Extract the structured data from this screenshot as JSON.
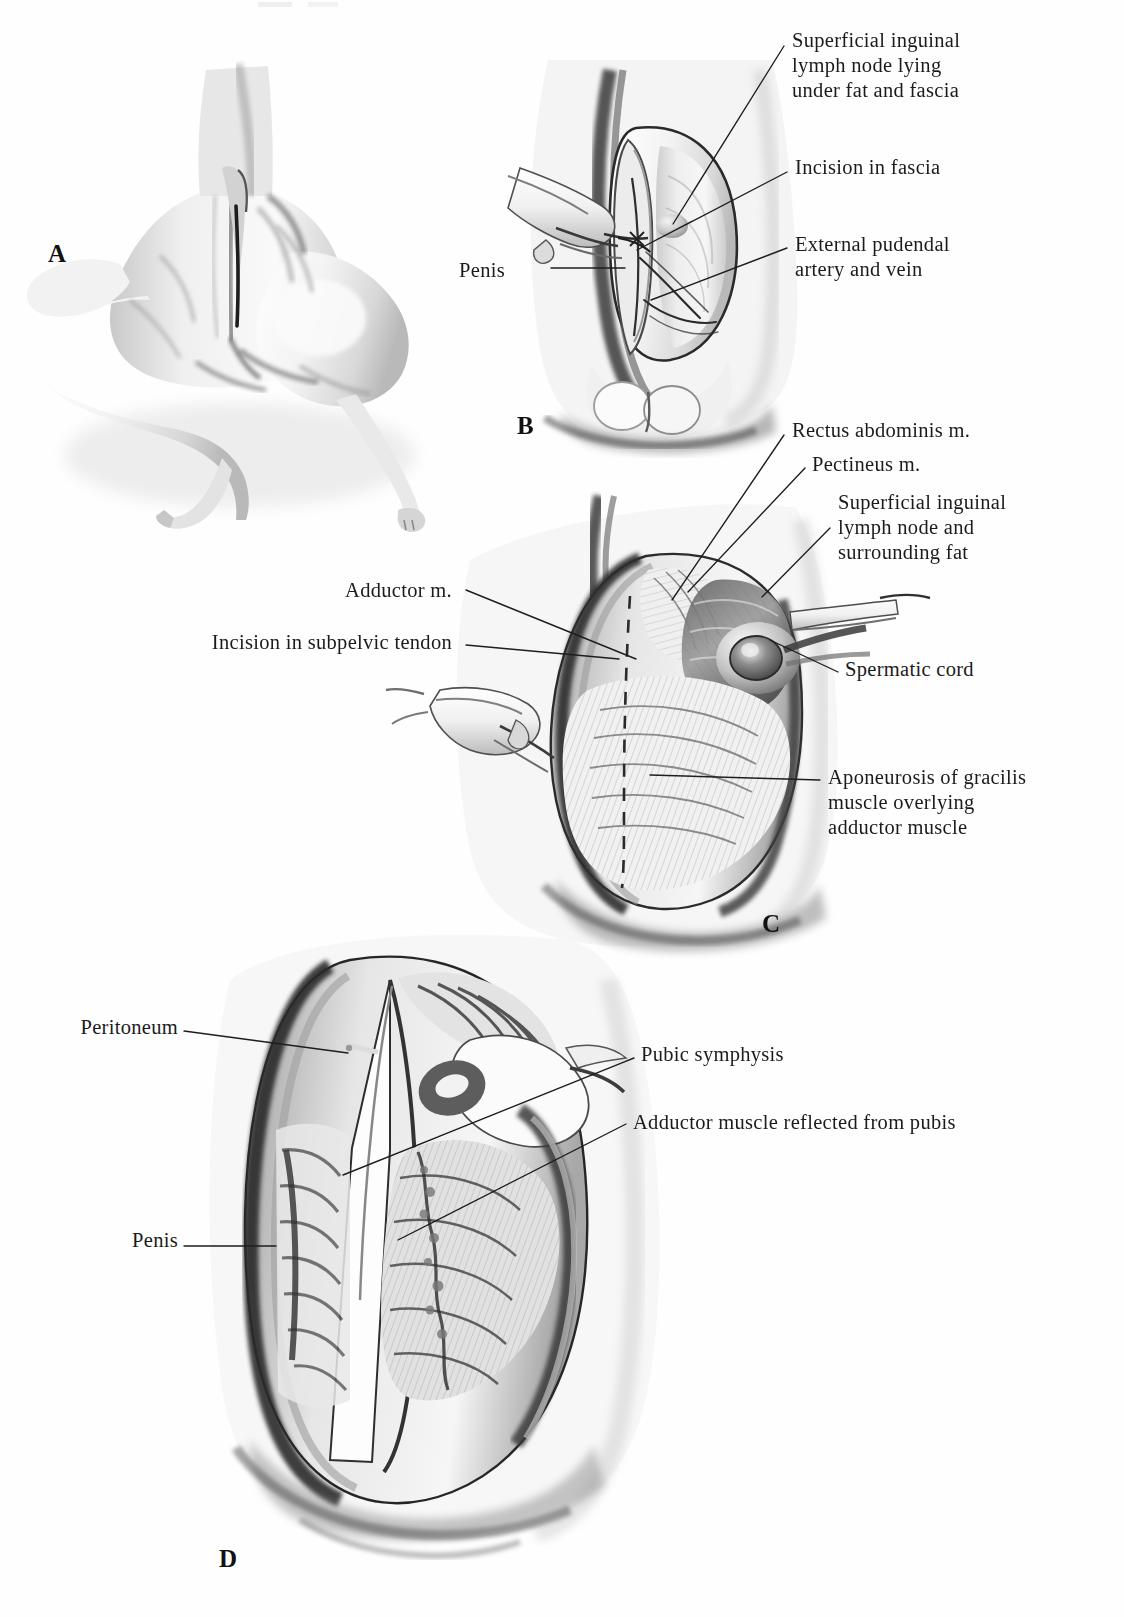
{
  "figure": {
    "kind": "surgical-atlas-plate",
    "panel_count": 4,
    "background": "#fefefe",
    "ink": "#1b1b1b"
  },
  "panels": [
    {
      "id": "A",
      "letter": "A",
      "caption_hint": "Dog positioned in dorsal recumbency showing inguinal region and planned incision",
      "letter_pos": {
        "x": 48,
        "y": 240
      }
    },
    {
      "id": "B",
      "letter": "B",
      "caption_hint": "Elliptical skin incision retracted exposing superficial inguinal structures",
      "letter_pos": {
        "x": 517,
        "y": 412
      }
    },
    {
      "id": "C",
      "letter": "C",
      "caption_hint": "Deeper dissection showing muscle planes with dashed line of subpelvic tendon incision",
      "letter_pos": {
        "x": 762,
        "y": 910
      }
    },
    {
      "id": "D",
      "letter": "D",
      "caption_hint": "Adductor muscle reflected from pubis exposing pubic symphysis and peritoneum",
      "letter_pos": {
        "x": 219,
        "y": 1545
      }
    }
  ],
  "labels": {
    "b": [
      {
        "name": "superficial-inguinal-lymph-node",
        "lines": [
          "Superficial inguinal",
          "lymph node lying",
          "under fat and fascia"
        ],
        "x": 792,
        "y": 28,
        "align": "left"
      },
      {
        "name": "incision-in-fascia",
        "lines": [
          "Incision in fascia"
        ],
        "x": 795,
        "y": 155,
        "align": "left"
      },
      {
        "name": "external-pudendal-artery-and-vein",
        "lines": [
          "External pudendal",
          "artery and vein"
        ],
        "x": 795,
        "y": 232,
        "align": "left"
      },
      {
        "name": "penis",
        "lines": [
          "Penis"
        ],
        "x": 505,
        "y": 258,
        "align": "right"
      }
    ],
    "c": [
      {
        "name": "rectus-abdominis-m",
        "lines": [
          "Rectus abdominis m."
        ],
        "x": 792,
        "y": 418,
        "align": "left"
      },
      {
        "name": "pectineus-m",
        "lines": [
          "Pectineus m."
        ],
        "x": 812,
        "y": 452,
        "align": "left"
      },
      {
        "name": "superficial-inguinal-lymph-node-and-fat",
        "lines": [
          "Superficial inguinal",
          "lymph node and",
          "surrounding fat"
        ],
        "x": 838,
        "y": 490,
        "align": "left"
      },
      {
        "name": "spermatic-cord",
        "lines": [
          "Spermatic cord"
        ],
        "x": 845,
        "y": 657,
        "align": "left"
      },
      {
        "name": "aponeurosis-of-gracilis",
        "lines": [
          "Aponeurosis of gracilis",
          "muscle overlying",
          "adductor muscle"
        ],
        "x": 828,
        "y": 765,
        "align": "left"
      },
      {
        "name": "adductor-m",
        "lines": [
          "Adductor m."
        ],
        "x": 452,
        "y": 578,
        "align": "right"
      },
      {
        "name": "incision-in-subpelvic-tendon",
        "lines": [
          "Incision in subpelvic tendon"
        ],
        "x": 452,
        "y": 630,
        "align": "right"
      }
    ],
    "d": [
      {
        "name": "peritoneum",
        "lines": [
          "Peritoneum"
        ],
        "x": 178,
        "y": 1015,
        "align": "right"
      },
      {
        "name": "penis",
        "lines": [
          "Penis"
        ],
        "x": 178,
        "y": 1228,
        "align": "right"
      },
      {
        "name": "pubic-symphysis",
        "lines": [
          "Pubic symphysis"
        ],
        "x": 641,
        "y": 1042,
        "align": "left"
      },
      {
        "name": "adductor-muscle-reflected-from-pubis",
        "lines": [
          "Adductor muscle reflected from pubis"
        ],
        "x": 633,
        "y": 1110,
        "align": "left"
      }
    ]
  },
  "leaders": {
    "b": [
      {
        "name": "leader-superficial-inguinal-lymph-node",
        "path": "M 784 46 L 673 224"
      },
      {
        "name": "leader-incision-in-fascia",
        "path": "M 787 172 L 637 250"
      },
      {
        "name": "leader-external-pudendal",
        "path": "M 787 248 L 651 300"
      },
      {
        "name": "leader-penis",
        "path": "M 551 268 L 625 268"
      }
    ],
    "c": [
      {
        "name": "leader-rectus-abdominis",
        "path": "M 784 435 L 672 600"
      },
      {
        "name": "leader-pectineus",
        "path": "M 805 468 L 688 592"
      },
      {
        "name": "leader-sup-ing-lymph-node-fat",
        "path": "M 830 528 L 762 597"
      },
      {
        "name": "leader-spermatic-cord",
        "path": "M 838 672 L 770 640"
      },
      {
        "name": "leader-aponeurosis",
        "path": "M 820 780 L 650 775"
      },
      {
        "name": "leader-adductor-m",
        "path": "M 466 590 L 636 659"
      },
      {
        "name": "leader-incision-subpelvic",
        "path": "M 466 645 L 619 659"
      }
    ],
    "d": [
      {
        "name": "leader-peritoneum",
        "path": "M 184 1031 L 348 1053"
      },
      {
        "name": "leader-penis",
        "path": "M 184 1246 L 276 1246"
      },
      {
        "name": "leader-pubic-symphysis",
        "path": "M 634 1058 L 343 1175"
      },
      {
        "name": "leader-adductor-reflected",
        "path": "M 626 1124 L 398 1240"
      }
    ]
  },
  "annotations": {
    "c_incision_dashed_line": {
      "name": "subpelvic-tendon-incision-dashed",
      "visible": true
    },
    "a_incision_line": {
      "name": "planned-incision-line",
      "visible": true
    }
  }
}
